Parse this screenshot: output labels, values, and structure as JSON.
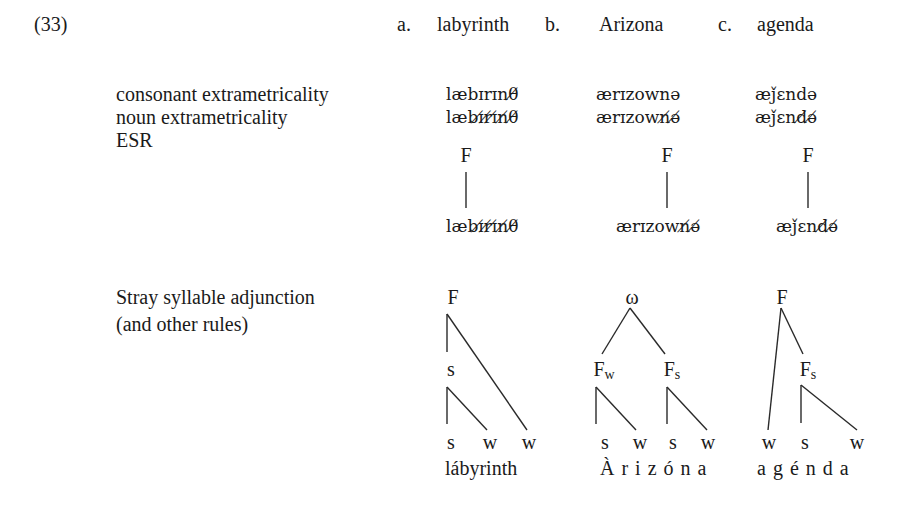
{
  "example": {
    "number": "(33)",
    "items": [
      {
        "letter": "a.",
        "word": "labyrinth"
      },
      {
        "letter": "b.",
        "word": "Arizona"
      },
      {
        "letter": "c.",
        "word": "agenda"
      }
    ]
  },
  "rules": {
    "consonant_extrametricality": {
      "label": "consonant extrametricality",
      "forms": [
        "læbɪrɪnθ̸",
        "ærɪzownə",
        "æǰɛndə"
      ]
    },
    "noun_extrametricality": {
      "label": "noun extrametricality",
      "forms": [
        "læbɪ̸r̸ɪ̸n̸θ̸",
        "ærɪzown̸ə̸",
        "æǰɛnd̸ə̸"
      ]
    },
    "esr": {
      "label": "ESR",
      "foot_label": "F",
      "forms": [
        "læbɪ̸r̸ɪ̸n̸θ̸",
        "ærɪzown̸ə̸",
        "æǰɛnd̸ə̸"
      ]
    },
    "stray": {
      "label_line1": "Stray syllable adjunction",
      "label_line2": "(and other rules)"
    }
  },
  "trees": {
    "a": {
      "root": "F",
      "mid": "s",
      "leaves": [
        "s",
        "w",
        "w"
      ],
      "word": "lábyrinth"
    },
    "b": {
      "root": "ω",
      "left_foot": "F",
      "left_foot_sub": "w",
      "right_foot": "F",
      "right_foot_sub": "s",
      "leaves": [
        "s",
        "w",
        "s",
        "w"
      ],
      "word": "À r i z ó n a"
    },
    "c": {
      "root": "F",
      "foot": "F",
      "foot_sub": "s",
      "leaves": [
        "w",
        "s",
        "w"
      ],
      "word": "a g é n d a"
    }
  }
}
